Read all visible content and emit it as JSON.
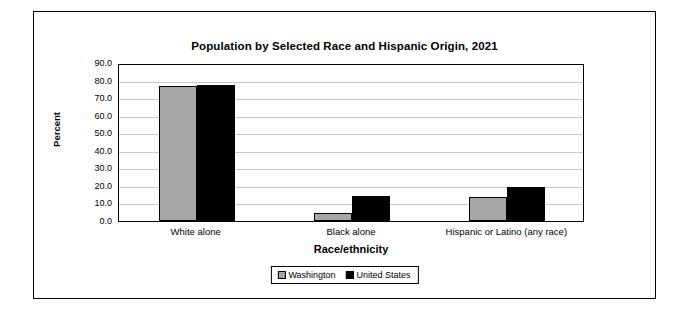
{
  "chart_data": {
    "type": "bar",
    "title": "Population by Selected Race and Hispanic Origin, 2021",
    "xlabel": "Race/ethnicity",
    "ylabel": "Percent",
    "categories": [
      "White alone",
      "Black alone",
      "Hispanic or Latino (any race)"
    ],
    "series": [
      {
        "name": "Washington",
        "values": [
          76.8,
          4.5,
          13.5
        ],
        "color": "#a6a6a6"
      },
      {
        "name": "United States",
        "values": [
          77.7,
          14.2,
          19.5
        ],
        "color": "#000000"
      }
    ],
    "ylim": [
      0.0,
      90.0
    ],
    "yticks": [
      "0.0",
      "10.0",
      "20.0",
      "30.0",
      "40.0",
      "50.0",
      "60.0",
      "70.0",
      "80.0",
      "90.0"
    ],
    "grid": true,
    "legend_position": "bottom"
  }
}
